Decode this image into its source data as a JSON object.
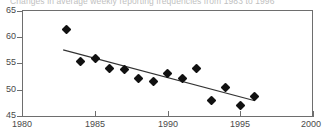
{
  "chart_data": {
    "type": "scatter",
    "title": "Changes in average weekly reporting frequencies from 1983 to 1996",
    "xlabel": "",
    "ylabel": "",
    "xlim": [
      1980,
      2000
    ],
    "ylim": [
      45,
      65
    ],
    "xticks": [
      1980,
      1985,
      1990,
      1995,
      2000
    ],
    "yticks": [
      45,
      50,
      55,
      60,
      65
    ],
    "grid": false,
    "legend": "none",
    "series": [
      {
        "name": "Average weekly reporting frequency",
        "marker": "filled-diamond",
        "color": "#111111",
        "x": [
          1983,
          1984,
          1985,
          1986,
          1987,
          1988,
          1989,
          1990,
          1991,
          1992,
          1993,
          1994,
          1995,
          1996
        ],
        "values": [
          61.5,
          55.3,
          56.0,
          54.0,
          53.8,
          52.2,
          51.6,
          53.1,
          52.1,
          54.1,
          47.9,
          50.4,
          47.0,
          48.8
        ]
      }
    ],
    "trendline": {
      "name": "linear fit",
      "color": "#333333",
      "x_start": 1982.8,
      "y_start": 57.6,
      "x_end": 1996.0,
      "y_end": 47.9
    }
  },
  "axis": {
    "y_labels": [
      "65",
      "60",
      "55",
      "50",
      "45"
    ],
    "x_labels": [
      "1980",
      "1985",
      "1990",
      "1995",
      "2000"
    ]
  }
}
